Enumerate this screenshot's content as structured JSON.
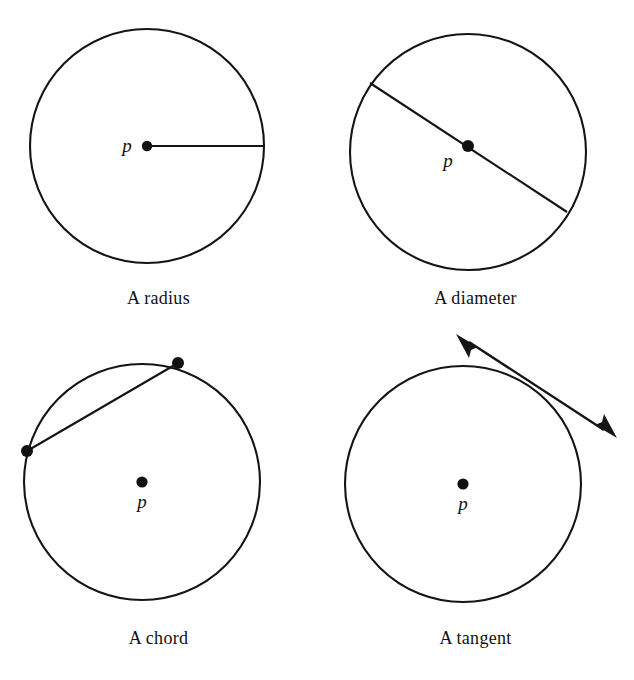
{
  "figure": {
    "background_color": "#ffffff",
    "ink_color": "#151515",
    "panels": [
      {
        "id": "radius",
        "caption": "A radius",
        "center_label": "p",
        "center_label_position": "left-of-dot",
        "circle": {
          "cx": 147,
          "cy": 146,
          "r": 117
        },
        "center_dot": {
          "cx": 147,
          "cy": 146,
          "r": 5.2
        },
        "segment": {
          "x1": 147,
          "y1": 146,
          "x2": 264,
          "y2": 146
        },
        "label_pos": {
          "x": 127,
          "y": 152
        },
        "endpoint_dots": []
      },
      {
        "id": "diameter",
        "caption": "A diameter",
        "center_label": "p",
        "center_label_position": "lower-left-of-dot",
        "circle": {
          "cx": 151,
          "cy": 152,
          "r": 118
        },
        "center_dot": {
          "cx": 151,
          "cy": 146,
          "r": 6.0
        },
        "segment": {
          "x1": 53,
          "y1": 83,
          "x2": 250,
          "y2": 212
        },
        "label_pos": {
          "x": 131,
          "y": 167
        },
        "endpoint_dots": []
      },
      {
        "id": "chord",
        "caption": "A chord",
        "center_label": "p",
        "center_label_position": "below-dot",
        "circle": {
          "cx": 142,
          "cy": 142,
          "r": 118
        },
        "center_dot": {
          "cx": 142,
          "cy": 142,
          "r": 5.6
        },
        "segment": {
          "x1": 27,
          "y1": 111,
          "x2": 178,
          "y2": 23
        },
        "label_pos": {
          "x": 142,
          "y": 168
        },
        "endpoint_dots": [
          {
            "cx": 27,
            "cy": 111,
            "r": 6.0
          },
          {
            "cx": 178,
            "cy": 23,
            "r": 6.0
          }
        ]
      },
      {
        "id": "tangent",
        "caption": "A tangent",
        "center_label": "p",
        "center_label_position": "below-dot",
        "circle": {
          "cx": 146,
          "cy": 144,
          "r": 118
        },
        "center_dot": {
          "cx": 146,
          "cy": 144,
          "r": 5.6
        },
        "tangent_arrow": {
          "tip_start": {
            "x": 139,
            "y": -6
          },
          "tip_end": {
            "x": 300,
            "y": 98
          },
          "touch_point": {
            "x": 228,
            "y": 50
          },
          "double_headed": true
        },
        "label_pos": {
          "x": 146,
          "y": 170
        },
        "endpoint_dots": []
      }
    ]
  }
}
